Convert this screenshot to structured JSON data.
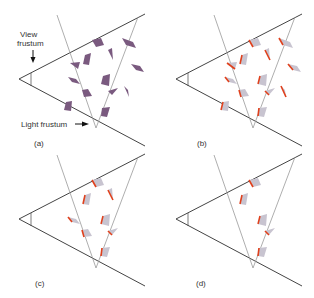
{
  "labels": {
    "view_frustum_line1": "View",
    "view_frustum_line2": "frustum",
    "light_frustum": "Light frustum"
  },
  "panels": [
    {
      "id": "a",
      "caption": "(a)",
      "description": "All occluders in view"
    },
    {
      "id": "b",
      "caption": "(b)",
      "description": "Occluders with silhouette edges"
    },
    {
      "id": "c",
      "caption": "(c)",
      "description": "Occluders inside light frustum"
    },
    {
      "id": "d",
      "caption": "(d)",
      "description": "Visible shadow casters"
    }
  ],
  "colors": {
    "frustum_line": "#444444",
    "light_line": "#999999",
    "occluder_fill": "#7a5a7f",
    "occluder_faded": "#c8c4d0",
    "silhouette_edge": "#e0401c"
  }
}
